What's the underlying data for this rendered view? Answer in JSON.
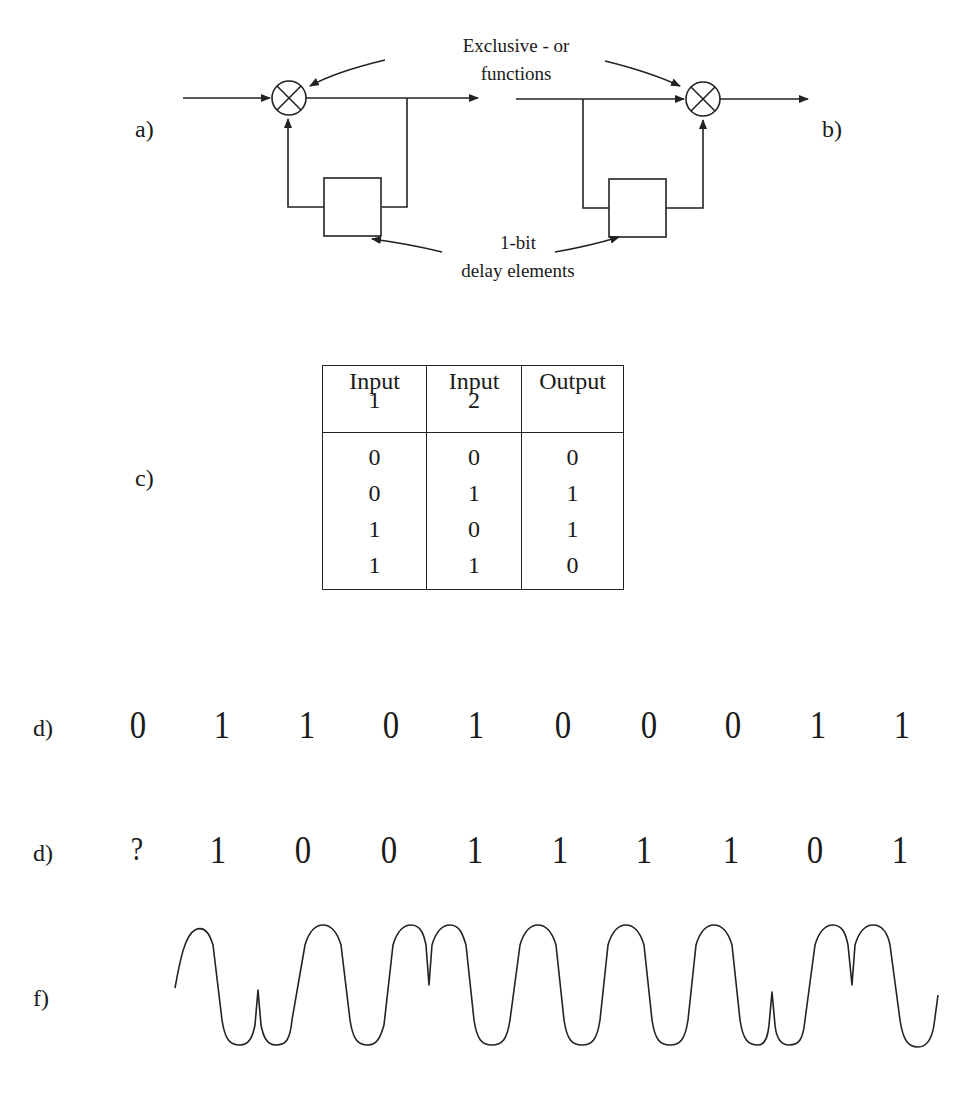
{
  "figure": {
    "panels": {
      "a": {
        "label": "a)"
      },
      "b": {
        "label": "b)"
      },
      "c": {
        "label": "c)"
      },
      "d1": {
        "label": "d)"
      },
      "d2": {
        "label": "d)"
      },
      "f": {
        "label": "f)"
      }
    },
    "annotations": {
      "xor_line1": "Exclusive - or",
      "xor_line2": "functions",
      "delay_line1": "1-bit",
      "delay_line2": "delay elements"
    },
    "truth_table": {
      "headers": [
        {
          "line1": "Input",
          "line2": "1"
        },
        {
          "line1": "Input",
          "line2": "2"
        },
        {
          "line1": "Output",
          "line2": ""
        }
      ],
      "rows": [
        [
          "0",
          "0",
          "0"
        ],
        [
          "0",
          "1",
          "1"
        ],
        [
          "1",
          "0",
          "1"
        ],
        [
          "1",
          "1",
          "0"
        ]
      ]
    },
    "input_bits": [
      "0",
      "1",
      "1",
      "0",
      "1",
      "0",
      "0",
      "0",
      "1",
      "1"
    ],
    "encoded_bits": [
      "?",
      "1",
      "0",
      "0",
      "1",
      "1",
      "1",
      "1",
      "0",
      "1"
    ],
    "waveform": {
      "description": "Phase-modulated carrier with phase reversals",
      "color": "#222222"
    },
    "colors": {
      "ink": "#1a1a1a",
      "background": "#ffffff"
    }
  }
}
